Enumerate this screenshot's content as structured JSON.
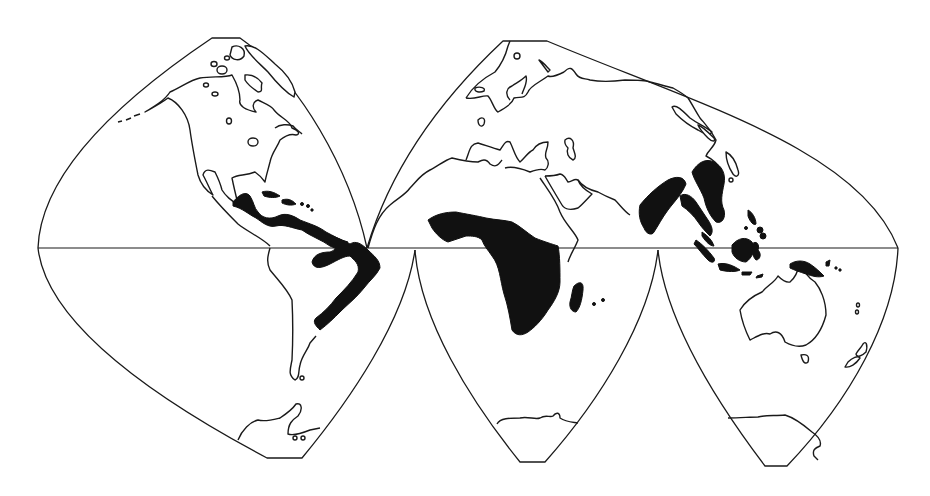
{
  "map": {
    "projection": "interrupted-homolosine",
    "background_color": "#ffffff",
    "line_color": "#1a1a1a",
    "highlight_color": "#111111",
    "lobes": [
      {
        "id": "north-america-lobe",
        "hemisphere": "north"
      },
      {
        "id": "eurasia-lobe",
        "hemisphere": "north"
      },
      {
        "id": "south-america-lobe",
        "hemisphere": "south"
      },
      {
        "id": "africa-lobe",
        "hemisphere": "south"
      },
      {
        "id": "oceania-lobe",
        "hemisphere": "south"
      }
    ],
    "outlined_landmasses": [
      "North America",
      "Greenland",
      "Arctic islands",
      "Europe",
      "Asia",
      "North Africa",
      "Arabian Peninsula",
      "South America (south)",
      "Australia",
      "Tasmania",
      "New Zealand",
      "Antarctica",
      "Japan",
      "Sri Lanka"
    ],
    "highlighted_regions": [
      "Central America",
      "Caribbean islands",
      "Northern South America",
      "Eastern Brazil",
      "Sub-Saharan Africa",
      "Madagascar",
      "India",
      "Southeast Asia",
      "Philippines",
      "Indonesia",
      "New Guinea"
    ]
  }
}
